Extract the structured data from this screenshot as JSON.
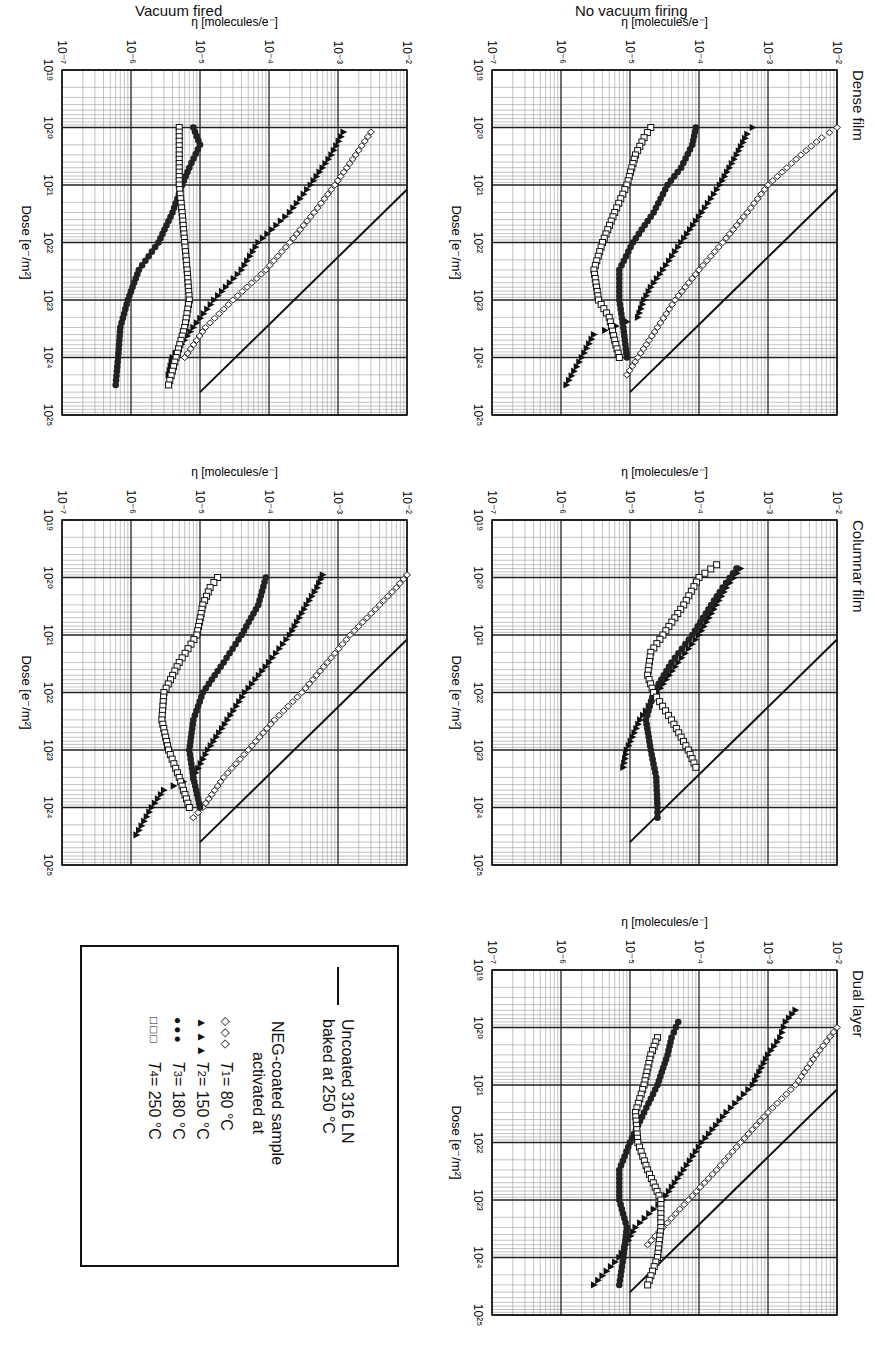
{
  "figure": {
    "row_labels": [
      "No vacuum firing",
      "Vacuum fired"
    ],
    "panel_titles": [
      "Dense film",
      "Columnar film",
      "Dual layer"
    ],
    "x_axis_label": "Dose [e⁻/m²]",
    "y_axis_label": "η [molecules/e⁻]",
    "x_ticks": [
      "10¹⁹",
      "10²⁰",
      "10²¹",
      "10²²",
      "10²³",
      "10²⁴",
      "10²⁵"
    ],
    "y_ticks": [
      "10⁻²",
      "10⁻³",
      "10⁻⁴",
      "10⁻⁵",
      "10⁻⁶",
      "10⁻⁷"
    ]
  },
  "legend": {
    "uncoated_line1": "Uncoated 316 LN",
    "uncoated_line2": "baked at 250 °C",
    "neg_line1": "NEG-coated sample",
    "neg_line2": "activated at",
    "entries": [
      {
        "symbol": "◇◇◇",
        "var": "T",
        "sub": "1",
        "text": " = 80 °C"
      },
      {
        "symbol": "▲▲▲",
        "var": "T",
        "sub": "2",
        "text": " = 150 °C"
      },
      {
        "symbol": "●●●",
        "var": "T",
        "sub": "3",
        "text": " = 180 °C"
      },
      {
        "symbol": "□□□",
        "var": "T",
        "sub": "4",
        "text": " = 250 °C"
      }
    ]
  },
  "chart_data": [
    {
      "type": "scatter",
      "title": "Dense film",
      "subtitle": "No vacuum firing",
      "xlabel": "Dose [e-/m2]",
      "ylabel": "eta [molecules/e-]",
      "xscale": "log",
      "yscale": "log",
      "xlim": [
        1e+19,
        1e+25
      ],
      "ylim": [
        1e-07,
        0.01
      ],
      "grid": true,
      "reference_line": {
        "name": "Uncoated 316 LN baked at 250 C",
        "x": [
          1.2e+21,
          4e+24
        ],
        "y": [
          0.01,
          1e-05
        ]
      },
      "series": [
        {
          "name": "T1 = 80 C",
          "marker": "diamond-open",
          "x": [
            1e+20,
            1.5e+20,
            3e+20,
            1e+21,
            3e+21,
            1e+22,
            3e+22,
            1e+23,
            3e+23,
            1e+24,
            2e+24
          ],
          "y": [
            0.01,
            0.006,
            0.003,
            0.001,
            0.0005,
            0.00022,
            0.0001,
            4.5e-05,
            2.5e-05,
            1.3e-05,
            9e-06
          ]
        },
        {
          "name": "T2 = 150 C",
          "marker": "triangle-filled",
          "x": [
            1e+20,
            1.3e+20,
            3e+20,
            1e+21,
            3e+21,
            1e+22,
            3e+22,
            6e+22,
            1e+23,
            2e+23,
            4e+23,
            1e+24,
            3e+24
          ],
          "y": [
            0.0006,
            0.0005,
            0.00035,
            0.0002,
            0.00011,
            5.5e-05,
            3e-05,
            2e-05,
            1.6e-05,
            1.3e-05,
            3e-06,
            2e-06,
            1.2e-06
          ]
        },
        {
          "name": "T3 = 180 C",
          "marker": "circle-filled",
          "x": [
            1e+20,
            2e+20,
            5e+20,
            1e+21,
            3e+21,
            1e+22,
            3e+22,
            1e+23,
            3e+23,
            1e+24
          ],
          "y": [
            9e-05,
            8e-05,
            5.5e-05,
            3.5e-05,
            2.2e-05,
            1.1e-05,
            7e-06,
            7e-06,
            8e-06,
            9e-06
          ]
        },
        {
          "name": "T4 = 250 C",
          "marker": "square-open",
          "x": [
            1e+20,
            1.5e+20,
            3e+20,
            1e+21,
            3e+21,
            1e+22,
            3e+22,
            1e+23,
            2e+23,
            5e+23,
            1e+24
          ],
          "y": [
            2e-05,
            1.6e-05,
            1.2e-05,
            9e-06,
            6e-06,
            4e-06,
            3e-06,
            3.5e-06,
            5e-06,
            6e-06,
            7e-06
          ]
        }
      ]
    },
    {
      "type": "scatter",
      "title": "Dense film",
      "subtitle": "Vacuum fired",
      "xlabel": "Dose [e-/m2]",
      "ylabel": "eta [molecules/e-]",
      "xscale": "log",
      "yscale": "log",
      "xlim": [
        1e+19,
        1e+25
      ],
      "ylim": [
        1e-07,
        0.01
      ],
      "grid": true,
      "reference_line": {
        "name": "Uncoated 316 LN baked at 250 C",
        "x": [
          1.2e+21,
          4e+24
        ],
        "y": [
          0.01,
          1e-05
        ]
      },
      "series": [
        {
          "name": "T1 = 80 C",
          "marker": "diamond-open",
          "x": [
            1.2e+20,
            3e+20,
            1e+21,
            3e+21,
            1e+22,
            3e+22,
            1e+23,
            3e+23,
            1e+24
          ],
          "y": [
            0.003,
            0.0018,
            0.0009,
            0.00045,
            0.0002,
            9e-05,
            3e-05,
            1.2e-05,
            6e-06
          ]
        },
        {
          "name": "T2 = 150 C",
          "marker": "triangle-filled",
          "x": [
            1.2e+20,
            3e+20,
            1e+21,
            3e+21,
            1e+22,
            3e+22,
            1e+23,
            3e+23,
            1e+24,
            2e+24
          ],
          "y": [
            0.0012,
            0.0008,
            0.0004,
            0.0002,
            7e-05,
            4e-05,
            1.6e-05,
            8e-06,
            4e-06,
            3.5e-06
          ]
        },
        {
          "name": "T3 = 180 C",
          "marker": "circle-filled",
          "x": [
            1e+20,
            2e+20,
            5e+20,
            1e+21,
            3e+21,
            1e+22,
            3e+22,
            1e+23,
            3e+23,
            1e+24,
            3e+24
          ],
          "y": [
            8e-06,
            1e-05,
            7e-06,
            5.5e-06,
            4e-06,
            2.5e-06,
            1.3e-06,
            9e-07,
            7e-07,
            6.5e-07,
            6e-07
          ]
        },
        {
          "name": "T4 = 250 C",
          "marker": "square-open",
          "x": [
            1e+20,
            3e+20,
            1e+21,
            3e+21,
            1e+22,
            3e+22,
            1e+23,
            3e+23,
            1e+24,
            3e+24
          ],
          "y": [
            5e-06,
            5e-06,
            5e-06,
            5.5e-06,
            6e-06,
            6.5e-06,
            7e-06,
            6e-06,
            4.5e-06,
            3.5e-06
          ]
        }
      ]
    },
    {
      "type": "scatter",
      "title": "Columnar film",
      "subtitle": "No vacuum firing",
      "xlabel": "Dose [e-/m2]",
      "ylabel": "eta [molecules/e-]",
      "xscale": "log",
      "yscale": "log",
      "xlim": [
        1e+19,
        1e+25
      ],
      "ylim": [
        1e-07,
        0.01
      ],
      "grid": true,
      "reference_line": {
        "name": "Uncoated 316 LN baked at 250 C",
        "x": [
          1.2e+21,
          4e+24
        ],
        "y": [
          0.01,
          1e-05
        ]
      },
      "series": [
        {
          "name": "T2 = 150 C",
          "marker": "triangle-filled",
          "x": [
            7e+19,
            1.5e+20,
            3e+20,
            1e+21,
            3e+21,
            1e+22,
            3e+22,
            1e+23,
            2e+23
          ],
          "y": [
            0.0004,
            0.00025,
            0.00018,
            0.0001,
            5e-05,
            2.5e-05,
            1.4e-05,
            9e-06,
            8e-06
          ]
        },
        {
          "name": "T3 = 180 C",
          "marker": "circle-filled",
          "x": [
            7e+19,
            1.5e+20,
            3e+20,
            1e+21,
            3e+21,
            1e+22,
            3e+22,
            1e+23,
            3e+23,
            1e+24,
            1.5e+24
          ],
          "y": [
            0.00035,
            0.00022,
            0.00015,
            8e-05,
            4e-05,
            2.2e-05,
            1.7e-05,
            2e-05,
            2.4e-05,
            2.5e-05,
            2.5e-05
          ]
        },
        {
          "name": "T4 = 250 C",
          "marker": "square-open",
          "x": [
            6e+19,
            1e+20,
            3e+20,
            1e+21,
            2e+21,
            5e+21,
            1e+22,
            3e+22,
            1e+23,
            2e+23
          ],
          "y": [
            0.00018,
            0.0001,
            6e-05,
            3e-05,
            2e-05,
            1.8e-05,
            2.2e-05,
            4e-05,
            7e-05,
            9e-05
          ]
        }
      ]
    },
    {
      "type": "scatter",
      "title": "Columnar film",
      "subtitle": "Vacuum fired",
      "xlabel": "Dose [e-/m2]",
      "ylabel": "eta [molecules/e-]",
      "xscale": "log",
      "yscale": "log",
      "xlim": [
        1e+19,
        1e+25
      ],
      "ylim": [
        1e-07,
        0.01
      ],
      "grid": true,
      "reference_line": {
        "name": "Uncoated 316 LN baked at 250 C",
        "x": [
          1.2e+21,
          4e+24
        ],
        "y": [
          0.01,
          1e-05
        ]
      },
      "series": [
        {
          "name": "T1 = 80 C",
          "marker": "diamond-open",
          "x": [
            9e+19,
            1.5e+20,
            3e+20,
            1e+21,
            3e+21,
            1e+22,
            3e+22,
            1e+23,
            3e+23,
            1e+24,
            1.5e+24
          ],
          "y": [
            0.01,
            0.007,
            0.004,
            0.0015,
            0.0007,
            0.0003,
            0.00012,
            5e-05,
            2.2e-05,
            1.1e-05,
            8e-06
          ]
        },
        {
          "name": "T2 = 150 C",
          "marker": "triangle-filled",
          "x": [
            9e+19,
            1.5e+20,
            3e+20,
            1e+21,
            3e+21,
            1e+22,
            3e+22,
            1e+23,
            3e+23,
            5e+23,
            1e+24,
            3e+24
          ],
          "y": [
            0.0006,
            0.0005,
            0.00035,
            0.0002,
            0.0001,
            4.5e-05,
            2.5e-05,
            1.3e-05,
            8e-06,
            3e-06,
            2e-06,
            1.2e-06
          ]
        },
        {
          "name": "T3 = 180 C",
          "marker": "circle-filled",
          "x": [
            1e+20,
            3e+20,
            1e+21,
            3e+21,
            1e+22,
            3e+22,
            1e+23,
            3e+23,
            1e+24
          ],
          "y": [
            9e-05,
            7e-05,
            4e-05,
            2.2e-05,
            1.1e-05,
            8e-06,
            7e-06,
            8e-06,
            1e-05
          ]
        },
        {
          "name": "T4 = 250 C",
          "marker": "square-open",
          "x": [
            1e+20,
            1.5e+20,
            3e+20,
            1e+21,
            3e+21,
            1e+22,
            3e+22,
            1e+23,
            3e+23,
            1e+24
          ],
          "y": [
            1.8e-05,
            1.4e-05,
            1.1e-05,
            9e-06,
            5e-06,
            3e-06,
            2.8e-06,
            3.5e-06,
            5e-06,
            7e-06
          ]
        }
      ]
    },
    {
      "type": "scatter",
      "title": "Dual layer",
      "subtitle": "No vacuum firing",
      "xlabel": "Dose [e-/m2]",
      "ylabel": "eta [molecules/e-]",
      "xscale": "log",
      "yscale": "log",
      "xlim": [
        1e+19,
        1e+25
      ],
      "ylim": [
        1e-07,
        0.01
      ],
      "grid": true,
      "reference_line": {
        "name": "Uncoated 316 LN baked at 250 C",
        "x": [
          1.2e+21,
          4e+24
        ],
        "y": [
          0.01,
          1e-05
        ]
      },
      "series": [
        {
          "name": "T1 = 80 C",
          "marker": "diamond-open",
          "x": [
            1e+20,
            3e+20,
            1e+21,
            3e+21,
            1e+22,
            3e+22,
            1e+23,
            3e+23,
            6e+23
          ],
          "y": [
            0.01,
            0.005,
            0.0025,
            0.001,
            0.0004,
            0.00018,
            7e-05,
            3e-05,
            1.8e-05
          ]
        },
        {
          "name": "T2 = 150 C",
          "marker": "triangle-filled",
          "x": [
            5e+19,
            8e+19,
            1.5e+20,
            3e+20,
            1e+21,
            3e+21,
            1e+22,
            3e+22,
            1e+23,
            3e+23,
            1e+24,
            3e+24
          ],
          "y": [
            0.0025,
            0.0018,
            0.0015,
            0.001,
            0.0006,
            0.00025,
            0.00011,
            6e-05,
            3e-05,
            1.2e-05,
            7e-06,
            3e-06
          ]
        },
        {
          "name": "T3 = 180 C",
          "marker": "circle-filled",
          "x": [
            8e+19,
            1.5e+20,
            3e+20,
            1e+21,
            3e+21,
            1e+22,
            3e+22,
            1e+23,
            3e+23,
            1e+24,
            3e+24
          ],
          "y": [
            5e-05,
            4e-05,
            3.5e-05,
            2.5e-05,
            1.6e-05,
            1e-05,
            7e-06,
            7e-06,
            9e-06,
            8e-06,
            7e-06
          ]
        },
        {
          "name": "T4 = 250 C",
          "marker": "square-open",
          "x": [
            1.5e+20,
            3e+20,
            1e+21,
            3e+21,
            1e+22,
            3e+22,
            1e+23,
            3e+23,
            1e+24,
            3e+24
          ],
          "y": [
            2.5e-05,
            2e-05,
            1.6e-05,
            1.2e-05,
            1.3e-05,
            1.8e-05,
            2.8e-05,
            2.8e-05,
            2.5e-05,
            1.8e-05
          ]
        }
      ]
    }
  ]
}
